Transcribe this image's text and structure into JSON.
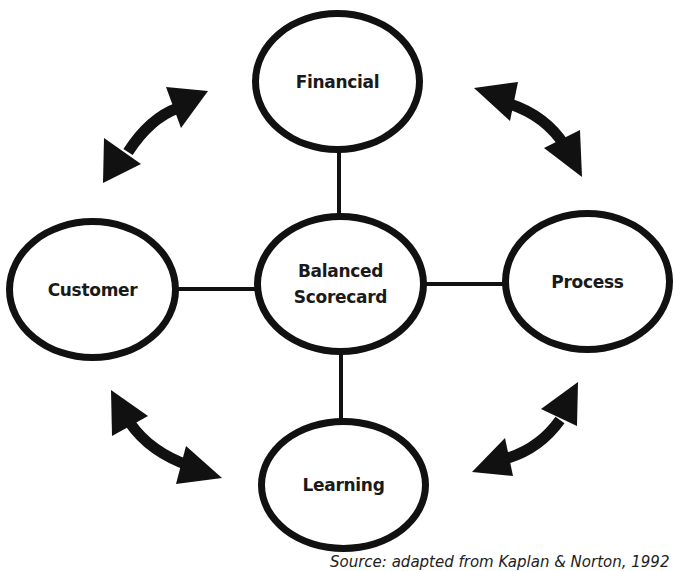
{
  "diagram": {
    "title": "Balanced Scorecard",
    "center": {
      "label": "Balanced\nScorecard"
    },
    "nodes": {
      "top": {
        "label": "Financial"
      },
      "left": {
        "label": "Customer"
      },
      "right": {
        "label": "Process"
      },
      "bottom": {
        "label": "Learning"
      }
    },
    "connectors": [
      {
        "from": "Balanced Scorecard",
        "to": "Financial"
      },
      {
        "from": "Balanced Scorecard",
        "to": "Customer"
      },
      {
        "from": "Balanced Scorecard",
        "to": "Process"
      },
      {
        "from": "Balanced Scorecard",
        "to": "Learning"
      }
    ],
    "bidirectional_arrows": [
      {
        "between": [
          "Customer",
          "Financial"
        ],
        "position": "top-left"
      },
      {
        "between": [
          "Financial",
          "Process"
        ],
        "position": "top-right"
      },
      {
        "between": [
          "Customer",
          "Learning"
        ],
        "position": "bottom-left"
      },
      {
        "between": [
          "Learning",
          "Process"
        ],
        "position": "bottom-right"
      }
    ],
    "caption": "Source: adapted from Kaplan & Norton, 1992",
    "colors": {
      "stroke": "#111111",
      "fill": "#ffffff",
      "text": "#1a1a1a"
    }
  }
}
